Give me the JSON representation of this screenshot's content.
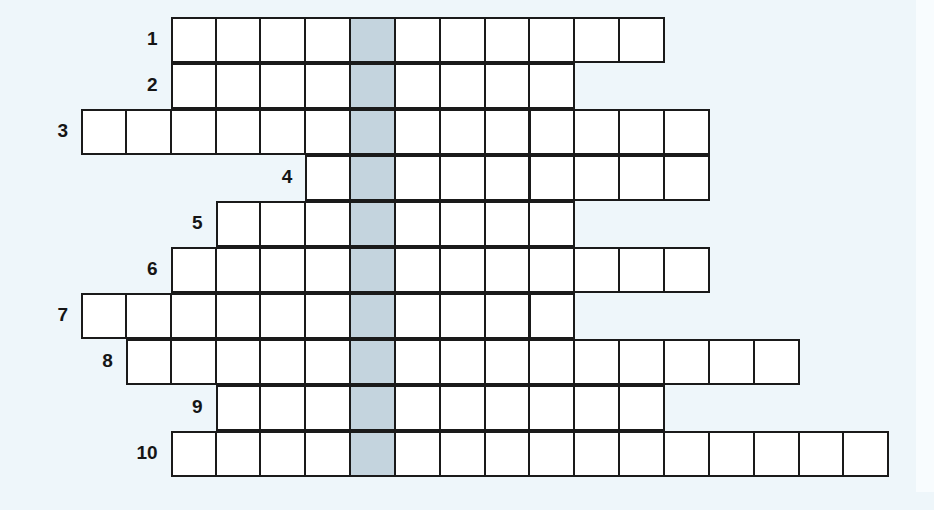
{
  "puzzle": {
    "type": "crossword",
    "grid": {
      "origin_x": 81,
      "origin_y": 17,
      "cell_width": 44.85,
      "cell_height": 46,
      "highlight_column": 6
    },
    "colors": {
      "background": "#eef6fa",
      "cell": "#ffffff",
      "highlight": "#c4d4de",
      "border": "#1a1a1a"
    },
    "rows": [
      {
        "number": "1",
        "start_col": 2,
        "length": 11
      },
      {
        "number": "2",
        "start_col": 2,
        "length": 9
      },
      {
        "number": "3",
        "start_col": 0,
        "length": 14
      },
      {
        "number": "4",
        "start_col": 5,
        "length": 9
      },
      {
        "number": "5",
        "start_col": 3,
        "length": 8
      },
      {
        "number": "6",
        "start_col": 2,
        "length": 12
      },
      {
        "number": "7",
        "start_col": 0,
        "length": 11
      },
      {
        "number": "8",
        "start_col": 1,
        "length": 15
      },
      {
        "number": "9",
        "start_col": 3,
        "length": 10
      },
      {
        "number": "10",
        "start_col": 2,
        "length": 16
      }
    ]
  }
}
